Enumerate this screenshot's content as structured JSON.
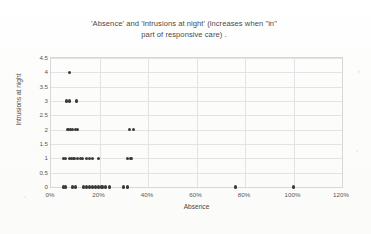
{
  "chart_data": {
    "type": "scatter",
    "title": "'Absence' and 'Intrusions at night' (increases when \"in\" part of responsive care) .",
    "title_line1": "'Absence' and 'Intrusions at night' (increases when \"in\"",
    "title_line2": "part of responsive care) .",
    "xlabel": "Absence",
    "ylabel": "Intrusions at night",
    "xlim": [
      0,
      120
    ],
    "ylim": [
      0,
      4.5
    ],
    "x_ticklabels": [
      "0%",
      "20%",
      "40%",
      "60%",
      "80%",
      "100%",
      "120%"
    ],
    "x_tickvalues": [
      0,
      20,
      40,
      60,
      80,
      100,
      120
    ],
    "y_ticklabels": [
      "0",
      "0.5",
      "1",
      "1.5",
      "2",
      "2.5",
      "3",
      "3.5",
      "4",
      "4.5"
    ],
    "y_tickvalues": [
      0,
      0.5,
      1,
      1.5,
      2,
      2.5,
      3,
      3.5,
      4,
      4.5
    ],
    "grid": true,
    "legend": false,
    "marker_color": "#3b3b3b",
    "gridline_color": "#e3e3e3",
    "points": [
      {
        "x": 5.0,
        "y": 0
      },
      {
        "x": 6.0,
        "y": 0
      },
      {
        "x": 9.0,
        "y": 0
      },
      {
        "x": 10.0,
        "y": 0
      },
      {
        "x": 13.5,
        "y": 0
      },
      {
        "x": 14.5,
        "y": 0
      },
      {
        "x": 16.0,
        "y": 0
      },
      {
        "x": 17.0,
        "y": 0
      },
      {
        "x": 18.5,
        "y": 0
      },
      {
        "x": 19.5,
        "y": 0
      },
      {
        "x": 21.0,
        "y": 0
      },
      {
        "x": 22.5,
        "y": 0
      },
      {
        "x": 24.0,
        "y": 0
      },
      {
        "x": 30.0,
        "y": 0
      },
      {
        "x": 31.5,
        "y": 0
      },
      {
        "x": 76.0,
        "y": 0
      },
      {
        "x": 100.0,
        "y": 0
      },
      {
        "x": 5.0,
        "y": 1
      },
      {
        "x": 6.0,
        "y": 1
      },
      {
        "x": 7.5,
        "y": 1
      },
      {
        "x": 8.5,
        "y": 1
      },
      {
        "x": 9.5,
        "y": 1
      },
      {
        "x": 11.0,
        "y": 1
      },
      {
        "x": 12.0,
        "y": 1
      },
      {
        "x": 13.0,
        "y": 1
      },
      {
        "x": 14.5,
        "y": 1
      },
      {
        "x": 16.0,
        "y": 1
      },
      {
        "x": 17.0,
        "y": 1
      },
      {
        "x": 19.5,
        "y": 1
      },
      {
        "x": 31.5,
        "y": 1
      },
      {
        "x": 33.0,
        "y": 1
      },
      {
        "x": 7.0,
        "y": 2
      },
      {
        "x": 8.0,
        "y": 2
      },
      {
        "x": 9.0,
        "y": 2
      },
      {
        "x": 10.0,
        "y": 2
      },
      {
        "x": 11.0,
        "y": 2
      },
      {
        "x": 32.5,
        "y": 2
      },
      {
        "x": 34.0,
        "y": 2
      },
      {
        "x": 6.5,
        "y": 3
      },
      {
        "x": 7.5,
        "y": 3
      },
      {
        "x": 10.5,
        "y": 3
      },
      {
        "x": 7.5,
        "y": 4
      }
    ]
  }
}
